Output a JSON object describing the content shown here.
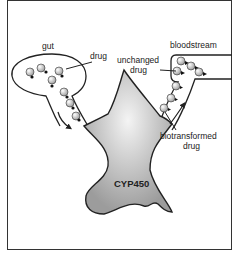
{
  "diagram": {
    "labels": {
      "gut": "gut",
      "drug": "drug",
      "bloodstream": "bloodstream",
      "unchanged_line1": "unchanged",
      "unchanged_line2": "drug",
      "biotransformed_line1": "biotransformed",
      "biotransformed_line2": "drug",
      "enzyme": "CYP450"
    },
    "colors": {
      "outline": "#222222",
      "enzyme_fill_light": "#f2f2f2",
      "enzyme_fill_dark": "#a8a8a8",
      "molecule_fill": "#d9d9d9"
    }
  }
}
